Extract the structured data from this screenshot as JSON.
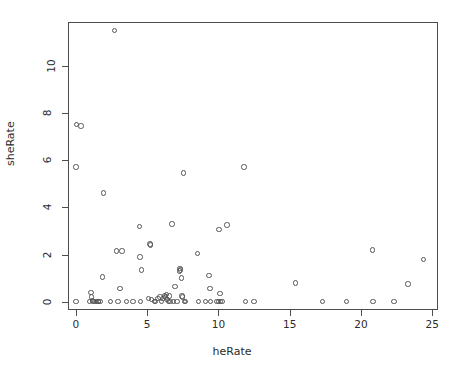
{
  "chart_data": {
    "type": "scatter",
    "title": "",
    "xlabel": "heRate",
    "ylabel": "sheRate",
    "xlim": [
      -0.55,
      25.4
    ],
    "ylim": [
      -0.35,
      11.85
    ],
    "xticks": [
      0,
      5,
      10,
      15,
      20,
      25
    ],
    "yticks": [
      0,
      2,
      4,
      6,
      8,
      10
    ],
    "xticklabels": [
      "0",
      "5",
      "10",
      "15",
      "20",
      "25"
    ],
    "yticklabels": [
      "0",
      "2",
      "4",
      "6",
      "8",
      "10"
    ],
    "grid": false,
    "legend": null,
    "marker": "open-circle",
    "marker_color": "#555555",
    "background": "#ffffff",
    "box_frame": true,
    "n_points": 98,
    "points": [
      [
        0.0,
        0.0
      ],
      [
        0.0,
        5.7
      ],
      [
        0.05,
        7.5
      ],
      [
        0.35,
        7.45
      ],
      [
        0.95,
        0.0
      ],
      [
        1.05,
        0.4
      ],
      [
        1.1,
        0.2
      ],
      [
        1.15,
        0.05
      ],
      [
        1.2,
        0.0
      ],
      [
        1.3,
        0.0
      ],
      [
        1.45,
        0.0
      ],
      [
        1.55,
        0.0
      ],
      [
        1.6,
        0.0
      ],
      [
        1.7,
        0.0
      ],
      [
        1.85,
        1.05
      ],
      [
        1.95,
        4.6
      ],
      [
        2.45,
        0.0
      ],
      [
        2.7,
        11.5
      ],
      [
        2.85,
        2.15
      ],
      [
        2.95,
        0.0
      ],
      [
        3.1,
        0.55
      ],
      [
        3.25,
        2.15
      ],
      [
        3.55,
        0.0
      ],
      [
        4.0,
        0.0
      ],
      [
        4.45,
        3.2
      ],
      [
        4.5,
        1.9
      ],
      [
        4.55,
        0.0
      ],
      [
        4.6,
        1.35
      ],
      [
        5.1,
        0.15
      ],
      [
        5.2,
        2.45
      ],
      [
        5.25,
        2.4
      ],
      [
        5.3,
        0.1
      ],
      [
        5.5,
        0.0
      ],
      [
        5.6,
        0.0
      ],
      [
        5.75,
        0.15
      ],
      [
        5.9,
        0.2
      ],
      [
        6.0,
        0.0
      ],
      [
        6.1,
        0.15
      ],
      [
        6.2,
        0.25
      ],
      [
        6.3,
        0.2
      ],
      [
        6.35,
        0.3
      ],
      [
        6.4,
        0.1
      ],
      [
        6.5,
        0.0
      ],
      [
        6.55,
        0.25
      ],
      [
        6.6,
        0.0
      ],
      [
        6.75,
        3.3
      ],
      [
        6.85,
        0.0
      ],
      [
        6.95,
        0.65
      ],
      [
        7.1,
        0.0
      ],
      [
        7.25,
        1.3
      ],
      [
        7.3,
        1.4
      ],
      [
        7.35,
        1.35
      ],
      [
        7.4,
        1.0
      ],
      [
        7.45,
        0.25
      ],
      [
        7.5,
        0.2
      ],
      [
        7.55,
        5.45
      ],
      [
        7.6,
        0.0
      ],
      [
        7.7,
        0.0
      ],
      [
        8.55,
        2.05
      ],
      [
        8.6,
        0.0
      ],
      [
        9.1,
        0.0
      ],
      [
        9.35,
        1.1
      ],
      [
        9.4,
        0.55
      ],
      [
        9.45,
        0.0
      ],
      [
        9.9,
        0.0
      ],
      [
        10.0,
        0.0
      ],
      [
        10.05,
        3.05
      ],
      [
        10.1,
        0.35
      ],
      [
        10.15,
        0.0
      ],
      [
        10.25,
        0.0
      ],
      [
        10.6,
        3.25
      ],
      [
        11.8,
        5.7
      ],
      [
        11.9,
        0.0
      ],
      [
        12.5,
        0.0
      ],
      [
        15.4,
        0.8
      ],
      [
        17.3,
        0.0
      ],
      [
        19.0,
        0.0
      ],
      [
        20.8,
        2.2
      ],
      [
        20.85,
        0.0
      ],
      [
        22.3,
        0.0
      ],
      [
        23.3,
        0.75
      ],
      [
        24.4,
        1.8
      ]
    ]
  }
}
